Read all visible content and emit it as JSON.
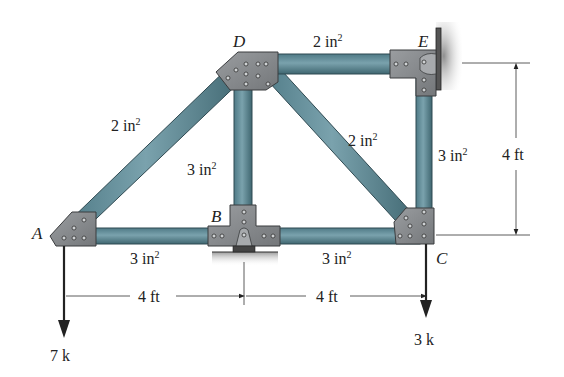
{
  "figure": {
    "colors": {
      "member": "#5f8994",
      "member_edge": "#2f4a52",
      "plate": "#8a8d90",
      "plate_edge": "#3a3c3e",
      "wall": "#9c9c9c",
      "line": "#222222"
    },
    "nodes": {
      "A": "A",
      "B": "B",
      "C": "C",
      "D": "D",
      "E": "E"
    },
    "members": {
      "AD": {
        "area": "2",
        "unit": "in"
      },
      "DE": {
        "area": "2",
        "unit": "in"
      },
      "DC": {
        "area": "2",
        "unit": "in"
      },
      "BD": {
        "area": "3",
        "unit": "in"
      },
      "EC": {
        "area": "3",
        "unit": "in"
      },
      "AB": {
        "area": "3",
        "unit": "in"
      },
      "BC": {
        "area": "3",
        "unit": "in"
      }
    },
    "dimensions": {
      "AB": "4 ft",
      "BC": "4 ft",
      "height": "4 ft"
    },
    "loads": {
      "A": "7 k",
      "C": "3 k"
    },
    "superscript": "2"
  }
}
